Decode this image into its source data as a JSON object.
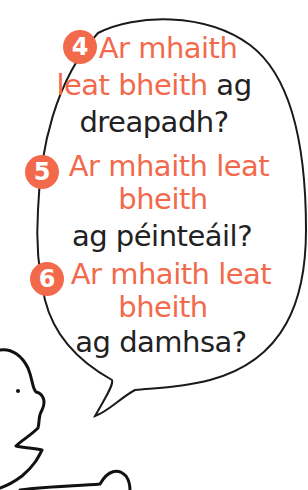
{
  "colors": {
    "accent": "#f26a4b",
    "text": "#222222",
    "outline": "#1a1a1a",
    "background": "#ffffff"
  },
  "speech_bubble": {
    "questions": [
      {
        "number": "4",
        "lines": [
          {
            "parts": [
              {
                "text": "Ar mhaith",
                "color": "orange"
              }
            ]
          },
          {
            "parts": [
              {
                "text": "leat bheith",
                "color": "orange"
              },
              {
                "text": " ag",
                "color": "dark"
              }
            ]
          },
          {
            "parts": [
              {
                "text": "dreapadh?",
                "color": "dark"
              }
            ]
          }
        ]
      },
      {
        "number": "5",
        "lines": [
          {
            "parts": [
              {
                "text": "Ar mhaith leat",
                "color": "orange"
              }
            ]
          },
          {
            "parts": [
              {
                "text": "bheith",
                "color": "orange"
              }
            ]
          },
          {
            "parts": [
              {
                "text": "ag péinteáil?",
                "color": "dark"
              }
            ]
          }
        ]
      },
      {
        "number": "6",
        "lines": [
          {
            "parts": [
              {
                "text": "Ar mhaith leat",
                "color": "orange"
              }
            ]
          },
          {
            "parts": [
              {
                "text": "bheith",
                "color": "orange"
              }
            ]
          },
          {
            "parts": [
              {
                "text": "ag damhsa?",
                "color": "dark"
              }
            ]
          }
        ]
      }
    ]
  },
  "illustration": {
    "character": "cartoon-face-profile",
    "bubble_shape": "speech-bubble-with-tail"
  }
}
